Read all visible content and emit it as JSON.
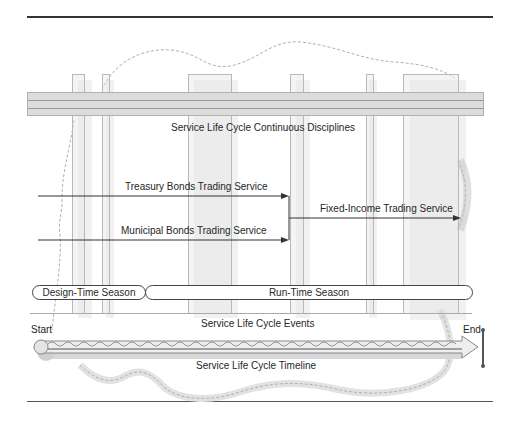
{
  "diagram": {
    "disciplines_band": {
      "label": "Service Life Cycle Continuous Disciplines"
    },
    "services": {
      "treasury": "Treasury Bonds Trading Service",
      "municipal": "Municipal Bonds Trading Service",
      "fixed_income": "Fixed-Income Trading Service"
    },
    "seasons": {
      "design_time": "Design-Time Season",
      "run_time": "Run-Time Season"
    },
    "events": {
      "label": "Service Life Cycle Events",
      "start": "Start",
      "end": "End"
    },
    "timeline": {
      "label": "Service Life Cycle Timeline"
    },
    "colors": {
      "line": "#333333",
      "band": "#dcdcdc",
      "pillar_border": "#b9b9b9",
      "timeline": "#cfcfcf",
      "dashed_path": "#a8a8a8"
    }
  }
}
